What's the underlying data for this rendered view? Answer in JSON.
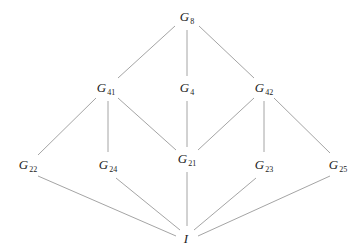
{
  "diagram": {
    "type": "subgroup-lattice",
    "nodes": [
      {
        "id": "G8",
        "base": "G",
        "sub": "8",
        "x": 187,
        "y": 18
      },
      {
        "id": "G41",
        "base": "G",
        "sub": "41",
        "x": 106,
        "y": 89
      },
      {
        "id": "G4",
        "base": "G",
        "sub": "4",
        "x": 187,
        "y": 89
      },
      {
        "id": "G42",
        "base": "G",
        "sub": "42",
        "x": 264,
        "y": 89
      },
      {
        "id": "G22",
        "base": "G",
        "sub": "22",
        "x": 28,
        "y": 166
      },
      {
        "id": "G24",
        "base": "G",
        "sub": "24",
        "x": 108,
        "y": 166
      },
      {
        "id": "G21",
        "base": "G",
        "sub": "21",
        "x": 187,
        "y": 160
      },
      {
        "id": "G23",
        "base": "G",
        "sub": "23",
        "x": 264,
        "y": 166
      },
      {
        "id": "G25",
        "base": "G",
        "sub": "25",
        "x": 338,
        "y": 166
      },
      {
        "id": "I",
        "base": "I",
        "sub": "",
        "x": 186,
        "y": 238
      }
    ],
    "edges": [
      {
        "from": "G8",
        "to": "G41",
        "x1": 175,
        "y1": 26,
        "x2": 118,
        "y2": 78
      },
      {
        "from": "G8",
        "to": "G4",
        "x1": 187,
        "y1": 30,
        "x2": 187,
        "y2": 76
      },
      {
        "from": "G8",
        "to": "G42",
        "x1": 199,
        "y1": 26,
        "x2": 254,
        "y2": 78
      },
      {
        "from": "G41",
        "to": "G22",
        "x1": 96,
        "y1": 98,
        "x2": 38,
        "y2": 155
      },
      {
        "from": "G41",
        "to": "G24",
        "x1": 108,
        "y1": 101,
        "x2": 108,
        "y2": 152
      },
      {
        "from": "G41",
        "to": "G21",
        "x1": 118,
        "y1": 98,
        "x2": 176,
        "y2": 150
      },
      {
        "from": "G4",
        "to": "G21",
        "x1": 187,
        "y1": 101,
        "x2": 187,
        "y2": 147
      },
      {
        "from": "G42",
        "to": "G21",
        "x1": 254,
        "y1": 98,
        "x2": 198,
        "y2": 150
      },
      {
        "from": "G42",
        "to": "G23",
        "x1": 264,
        "y1": 101,
        "x2": 264,
        "y2": 152
      },
      {
        "from": "G42",
        "to": "G25",
        "x1": 274,
        "y1": 98,
        "x2": 330,
        "y2": 153
      },
      {
        "from": "G22",
        "to": "I",
        "x1": 38,
        "y1": 176,
        "x2": 176,
        "y2": 236
      },
      {
        "from": "G24",
        "to": "I",
        "x1": 116,
        "y1": 178,
        "x2": 180,
        "y2": 230
      },
      {
        "from": "G21",
        "to": "I",
        "x1": 187,
        "y1": 172,
        "x2": 187,
        "y2": 226
      },
      {
        "from": "G23",
        "to": "I",
        "x1": 256,
        "y1": 178,
        "x2": 194,
        "y2": 230
      },
      {
        "from": "G25",
        "to": "I",
        "x1": 330,
        "y1": 176,
        "x2": 198,
        "y2": 236
      }
    ]
  }
}
